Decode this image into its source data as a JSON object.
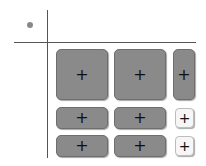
{
  "grid": {
    "corner_indicator": "dot",
    "rows": [
      {
        "cells": [
          {
            "icon": "plus-icon",
            "glyph": "+",
            "style": "dark"
          },
          {
            "icon": "plus-icon",
            "glyph": "+",
            "style": "dark"
          },
          {
            "icon": "plus-icon",
            "glyph": "+",
            "style": "dark"
          }
        ]
      },
      {
        "cells": [
          {
            "icon": "plus-icon",
            "glyph": "+",
            "style": "dark"
          },
          {
            "icon": "plus-icon",
            "glyph": "+",
            "style": "dark"
          },
          {
            "icon": "plus-icon",
            "glyph": "+",
            "style": "light"
          }
        ]
      },
      {
        "cells": [
          {
            "icon": "plus-icon",
            "glyph": "+",
            "style": "dark"
          },
          {
            "icon": "plus-icon",
            "glyph": "+",
            "style": "dark"
          },
          {
            "icon": "plus-icon",
            "glyph": "+",
            "style": "light"
          }
        ]
      }
    ]
  },
  "colors": {
    "button_dark": "#8a8a8a",
    "button_light": "#f6f6f6",
    "lines": "#555555",
    "dot": "#888888"
  }
}
